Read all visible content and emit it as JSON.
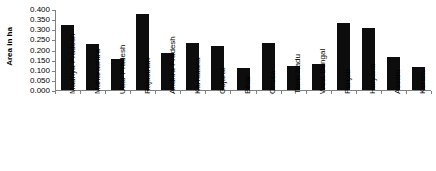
{
  "chart_data": {
    "type": "bar",
    "title": "",
    "xlabel": "",
    "ylabel": "Area in ha",
    "ylim": [
      0,
      0.4
    ],
    "grid": false,
    "legend": null,
    "bar_color": "#0d0d0d",
    "axis_color": "#808080",
    "categories": [
      "Madhya Pradesh",
      "Maharashtra",
      "Uttar Pradesh",
      "Rajasthan",
      "Andhra Pradesh",
      "Karnataka",
      "Gujarat",
      "Bihar",
      "Orissa",
      "Tamil Nadu",
      "West Bengal",
      "Punjab",
      "Haryana",
      "Assam",
      "Kerala"
    ],
    "values": [
      0.32,
      0.228,
      0.155,
      0.375,
      0.185,
      0.232,
      0.218,
      0.11,
      0.23,
      0.12,
      0.128,
      0.33,
      0.305,
      0.165,
      0.115
    ],
    "ytick_values": [
      0.4,
      0.35,
      0.3,
      0.25,
      0.2,
      0.15,
      0.1,
      0.05,
      0.0
    ],
    "ytick_labels": [
      "0.400",
      "0.350",
      "0.300",
      "0.250",
      "0.200",
      "0.150",
      "0.100",
      "0.050",
      "0.000"
    ]
  }
}
